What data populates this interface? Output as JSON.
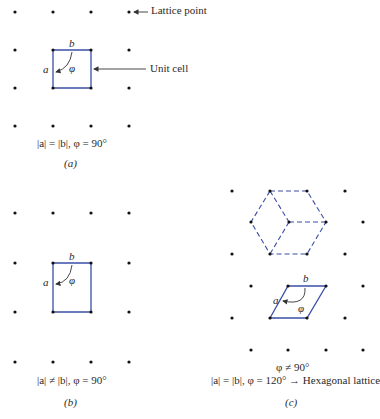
{
  "colors": {
    "cell": "#3a4fa8",
    "dot": "#111111",
    "arrow": "#333333",
    "text": "#2a2a2a"
  },
  "panel_a": {
    "annotation_lattice_point": "Lattice point",
    "annotation_unit_cell": "Unit cell",
    "vector_a": "a",
    "vector_b": "b",
    "angle": "φ",
    "condition": "|a| = |b|, φ = 90°",
    "caption": "(a)",
    "lattice_points": [
      [
        15,
        12
      ],
      [
        53,
        12
      ],
      [
        91,
        12
      ],
      [
        129,
        12
      ],
      [
        15,
        50
      ],
      [
        53,
        50
      ],
      [
        91,
        50
      ],
      [
        129,
        50
      ],
      [
        15,
        88
      ],
      [
        53,
        88
      ],
      [
        91,
        88
      ],
      [
        129,
        88
      ],
      [
        15,
        126
      ],
      [
        53,
        126
      ],
      [
        91,
        126
      ],
      [
        129,
        126
      ]
    ],
    "unit_cell": [
      [
        53,
        50
      ],
      [
        91,
        50
      ],
      [
        91,
        88
      ],
      [
        53,
        88
      ]
    ]
  },
  "panel_b": {
    "vector_a": "a",
    "vector_b": "b",
    "angle": "φ",
    "condition": "|a| ≠ |b|, φ = 90°",
    "caption": "(b)",
    "lattice_points": [
      [
        15,
        213
      ],
      [
        53,
        213
      ],
      [
        91,
        213
      ],
      [
        129,
        213
      ],
      [
        15,
        263
      ],
      [
        53,
        263
      ],
      [
        91,
        263
      ],
      [
        129,
        263
      ],
      [
        15,
        312
      ],
      [
        53,
        312
      ],
      [
        91,
        312
      ],
      [
        129,
        312
      ],
      [
        15,
        362
      ],
      [
        53,
        362
      ],
      [
        91,
        362
      ],
      [
        129,
        362
      ]
    ],
    "unit_cell": [
      [
        53,
        263
      ],
      [
        91,
        263
      ],
      [
        91,
        312
      ],
      [
        53,
        312
      ]
    ]
  },
  "panel_c": {
    "vector_a": "a",
    "vector_b": "b",
    "angle": "φ",
    "condition_line1": "φ ≠ 90°",
    "condition_line2": "|a| = |b|, φ = 120° → Hexagonal lattice",
    "caption": "(c)",
    "lattice_points": [
      [
        232,
        191
      ],
      [
        270,
        191
      ],
      [
        307,
        191
      ],
      [
        345,
        191
      ],
      [
        251,
        222
      ],
      [
        289,
        222
      ],
      [
        326,
        222
      ],
      [
        363,
        222
      ],
      [
        232,
        254
      ],
      [
        270,
        254
      ],
      [
        307,
        254
      ],
      [
        345,
        254
      ],
      [
        251,
        286
      ],
      [
        288,
        286
      ],
      [
        326,
        286
      ],
      [
        363,
        286
      ],
      [
        232,
        318
      ],
      [
        270,
        318
      ],
      [
        307,
        318
      ],
      [
        345,
        318
      ],
      [
        251,
        350
      ],
      [
        288,
        350
      ],
      [
        326,
        350
      ],
      [
        363,
        350
      ]
    ],
    "unit_cell": [
      [
        288,
        286
      ],
      [
        326,
        286
      ],
      [
        307,
        318
      ],
      [
        270,
        318
      ]
    ]
  }
}
